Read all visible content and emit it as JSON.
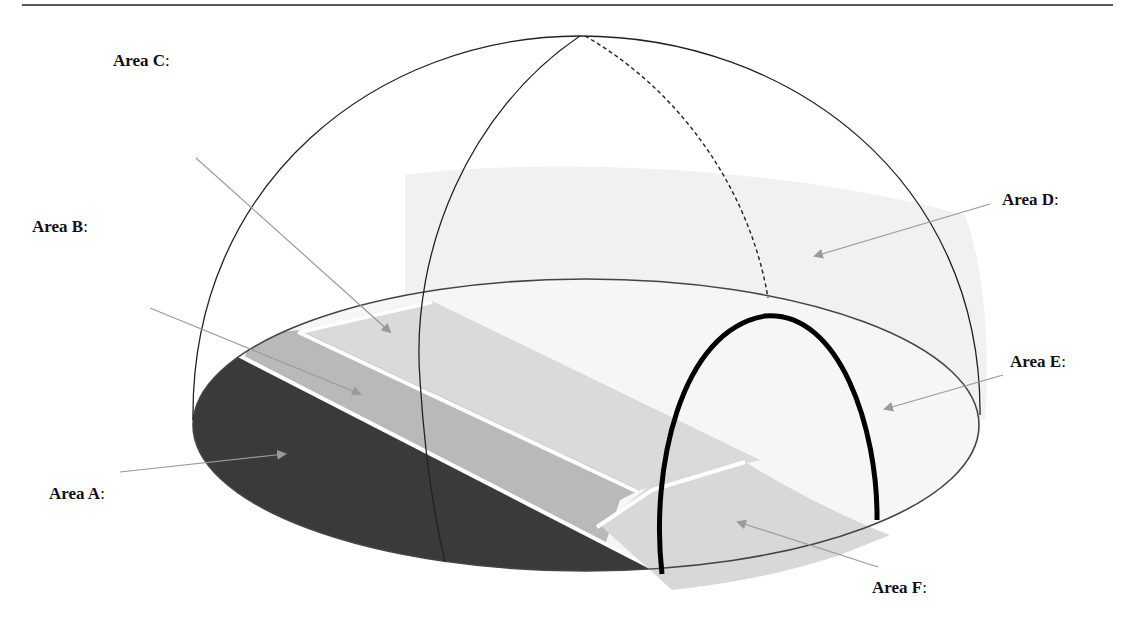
{
  "diagram": {
    "labels": [
      {
        "id": "A",
        "text": "Area A",
        "suffix": ":"
      },
      {
        "id": "B",
        "text": "Area B",
        "suffix": ":"
      },
      {
        "id": "C",
        "text": "Area C",
        "suffix": ":"
      },
      {
        "id": "D",
        "text": "Area D",
        "suffix": ":"
      },
      {
        "id": "E",
        "text": "Area E",
        "suffix": ":"
      },
      {
        "id": "F",
        "text": "Area F",
        "suffix": ":"
      }
    ],
    "colors": {
      "area_a": "#3a3a3a",
      "area_b": "#b9b9b9",
      "area_c": "#dadada",
      "area_d": "#f1f1f1",
      "area_e": "#f6f6f6",
      "area_f": "#d8d8d8",
      "arrow": "#9a9a9a",
      "outline": "#222222"
    }
  }
}
